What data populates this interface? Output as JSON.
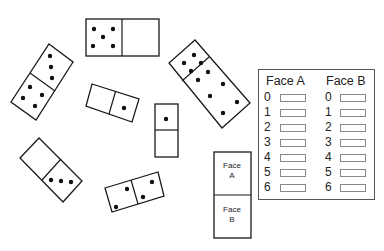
{
  "dominoes": [
    {
      "id": "top-horizontal",
      "halves": [
        5,
        0
      ]
    },
    {
      "id": "left-tilted",
      "halves": [
        3,
        4
      ]
    },
    {
      "id": "middle-tilted",
      "halves": [
        0,
        1
      ]
    },
    {
      "id": "vertical-small",
      "halves": [
        1,
        0
      ]
    },
    {
      "id": "right-tilted",
      "halves": [
        6,
        4
      ]
    },
    {
      "id": "lower-left-tilted",
      "halves": [
        0,
        3
      ]
    },
    {
      "id": "bottom-tilted",
      "halves": [
        2,
        2
      ]
    }
  ],
  "legend_domino": {
    "face_a_line1": "Face",
    "face_a_line2": "A",
    "face_b_line1": "Face",
    "face_b_line2": "B"
  },
  "record_table": {
    "face_a_header": "Face A",
    "face_b_header": "Face B",
    "rows": [
      {
        "label": "0",
        "face_a": "",
        "face_b": ""
      },
      {
        "label": "1",
        "face_a": "",
        "face_b": ""
      },
      {
        "label": "2",
        "face_a": "",
        "face_b": ""
      },
      {
        "label": "3",
        "face_a": "",
        "face_b": ""
      },
      {
        "label": "4",
        "face_a": "",
        "face_b": ""
      },
      {
        "label": "5",
        "face_a": "",
        "face_b": ""
      },
      {
        "label": "6",
        "face_a": "",
        "face_b": ""
      }
    ]
  }
}
